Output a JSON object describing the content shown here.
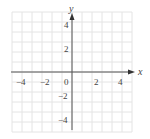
{
  "chart_data": {
    "type": "scatter",
    "title": "",
    "xlabel": "x",
    "ylabel": "y",
    "xlim": [
      -6,
      6
    ],
    "ylim": [
      -6,
      6
    ],
    "grid": true,
    "grid_step": 1,
    "x_ticks": [
      {
        "value": -4,
        "label": "−4"
      },
      {
        "value": -2,
        "label": "−2"
      },
      {
        "value": 0,
        "label": "0"
      },
      {
        "value": 2,
        "label": "2"
      },
      {
        "value": 4,
        "label": "4"
      }
    ],
    "y_ticks": [
      {
        "value": 4,
        "label": "4"
      },
      {
        "value": 2,
        "label": "2"
      },
      {
        "value": -2,
        "label": "−2"
      },
      {
        "value": -4,
        "label": "−4"
      }
    ],
    "series": [],
    "colors": {
      "grid": "#e4e4e4",
      "axis": "#555555",
      "text": "#444444"
    }
  }
}
